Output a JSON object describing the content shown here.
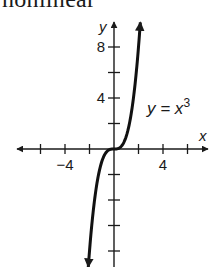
{
  "page": {
    "cut_heading": "nonlinear"
  },
  "chart_data": {
    "type": "line",
    "title": "",
    "function_label": "y = x",
    "function_exponent": "3",
    "xlabel": "x",
    "ylabel": "y",
    "x_tick_labels": [
      {
        "value": -4,
        "label": "−4"
      },
      {
        "value": 4,
        "label": "4"
      }
    ],
    "y_tick_labels": [
      {
        "value": 8,
        "label": "8"
      },
      {
        "value": 4,
        "label": "4"
      }
    ],
    "x_ticks": [
      -6,
      -4,
      -2,
      0,
      2,
      4,
      6
    ],
    "y_ticks": [
      -8,
      -6,
      -4,
      -2,
      0,
      2,
      4,
      6,
      8
    ],
    "xlim": [
      -8,
      7.5
    ],
    "ylim": [
      -9.3,
      10
    ],
    "grid": false,
    "series": [
      {
        "name": "y = x^3",
        "x": [
          -2.1,
          -2,
          -1.5,
          -1,
          -0.5,
          0,
          0.5,
          1,
          1.5,
          2,
          2.15
        ],
        "y": [
          -9.26,
          -8,
          -3.375,
          -1,
          -0.125,
          0,
          0.125,
          1,
          3.375,
          8,
          9.94
        ]
      }
    ],
    "arrows": "both ends of curve and both axes"
  }
}
